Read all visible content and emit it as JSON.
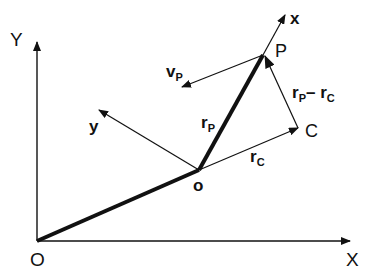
{
  "diagram": {
    "title": "",
    "labels": {
      "global_x_axis": "X",
      "global_y_axis": "Y",
      "global_origin": "O",
      "local_x_axis": "x",
      "local_y_axis": "y",
      "local_origin": "o",
      "point_p": "P",
      "point_c": "C",
      "velocity_main": "v",
      "velocity_sub": "P",
      "rp_main": "r",
      "rp_sub": "P",
      "rc_main": "r",
      "rc_sub": "C",
      "diff_main1": "r",
      "diff_sub1": "P",
      "diff_minus": "–",
      "diff_main2": "r",
      "diff_sub2": "C"
    },
    "colors": {
      "ink": "#111111",
      "background": "#ffffff"
    }
  }
}
